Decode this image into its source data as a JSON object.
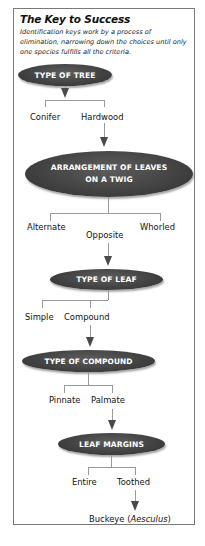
{
  "header": {
    "title": "The Key to Success",
    "description": "Identification keys work by a process of elimination, narrowing down the choices until only one species fulfills all the criteria."
  },
  "nodes": {
    "type_of_tree": "TYPE OF TREE",
    "arrangement_line1": "ARRANGEMENT OF LEAVES",
    "arrangement_line2": "ON A TWIG",
    "type_of_leaf": "TYPE OF LEAF",
    "type_of_compound": "TYPE OF COMPOUND",
    "leaf_margins": "LEAF MARGINS"
  },
  "options": {
    "type_of_tree": [
      "Conifer",
      "Hardwood"
    ],
    "arrangement": [
      "Alternate",
      "Opposite",
      "Whorled"
    ],
    "type_of_leaf": [
      "Simple",
      "Compound"
    ],
    "type_of_compound": [
      "Pinnate",
      "Palmate"
    ],
    "leaf_margins": [
      "Entire",
      "Toothed"
    ]
  },
  "result": {
    "common_name": "Buckeye (",
    "genus": "Aesculus",
    "close": ")"
  },
  "colors": {
    "oval_fill": "#434343",
    "oval_text": "#ffffff",
    "connector": "#9a9a9a",
    "arrow": "#4a4a4a",
    "frame_border": "#7a7a7a"
  }
}
